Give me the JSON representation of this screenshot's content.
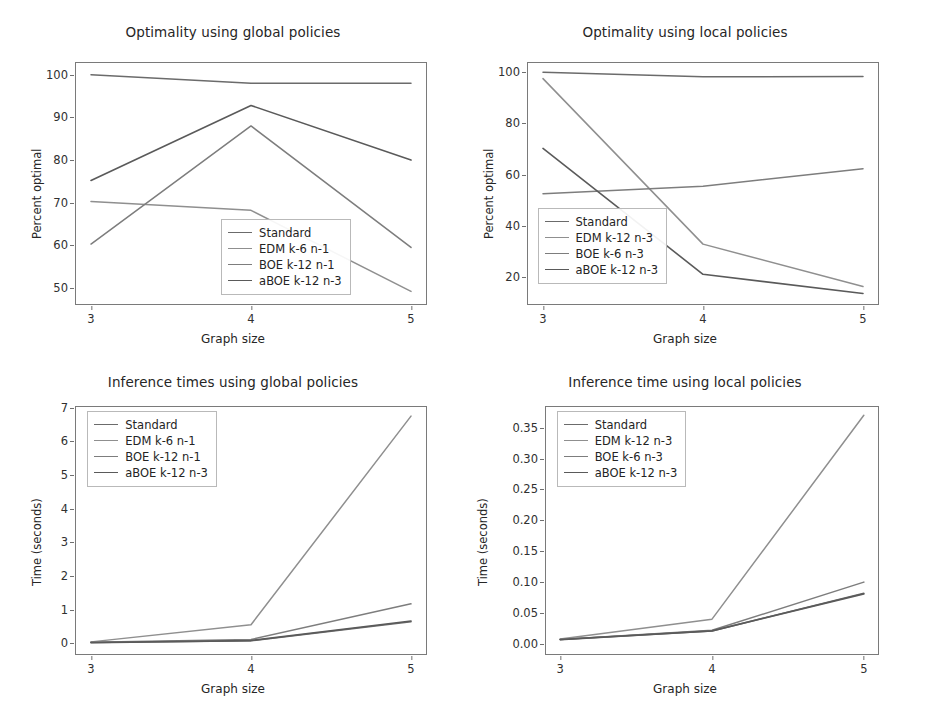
{
  "figure": {
    "background": "#ffffff",
    "palette": {
      "standard": "#6b6b6b",
      "edm": "#8f8f8f",
      "boe": "#7d7d7d",
      "aboe": "#5a5a5a"
    }
  },
  "chart_data": [
    {
      "id": "optimality-global",
      "type": "line",
      "title": "Optimality using global policies",
      "xlabel": "Graph size",
      "ylabel": "Percent optimal",
      "x": [
        3,
        4,
        5
      ],
      "xticklabels": [
        "3",
        "4",
        "5"
      ],
      "xlim": [
        2.9,
        5.1
      ],
      "ylim": [
        46,
        103
      ],
      "yticks": [
        50,
        60,
        70,
        80,
        90,
        100
      ],
      "yticklabels": [
        "50",
        "60",
        "70",
        "80",
        "90",
        "100"
      ],
      "grid": false,
      "legend_position": "center right",
      "series": [
        {
          "name": "Standard",
          "color": "#6b6b6b",
          "width": 1.5,
          "values": [
            100,
            98,
            98
          ]
        },
        {
          "name": "EDM k-6 n-1",
          "color": "#8f8f8f",
          "width": 1.5,
          "values": [
            70.3,
            68.2,
            49.2
          ]
        },
        {
          "name": "BOE k-12 n-1",
          "color": "#7d7d7d",
          "width": 1.5,
          "values": [
            60.3,
            88,
            59.5
          ]
        },
        {
          "name": "aBOE k-12 n-3",
          "color": "#5a5a5a",
          "width": 1.6,
          "values": [
            75.2,
            92.8,
            80
          ]
        }
      ]
    },
    {
      "id": "optimality-local",
      "type": "line",
      "title": "Optimality using local policies",
      "xlabel": "Graph size",
      "ylabel": "Percent optimal",
      "x": [
        3,
        4,
        5
      ],
      "xticklabels": [
        "3",
        "4",
        "5"
      ],
      "xlim": [
        2.9,
        5.1
      ],
      "ylim": [
        9,
        104
      ],
      "yticks": [
        20,
        40,
        60,
        80,
        100
      ],
      "yticklabels": [
        "20",
        "40",
        "60",
        "80",
        "100"
      ],
      "grid": false,
      "legend_position": "lower left",
      "series": [
        {
          "name": "Standard",
          "color": "#6b6b6b",
          "width": 1.5,
          "values": [
            100,
            98.2,
            98.3
          ]
        },
        {
          "name": "EDM k-12 n-3",
          "color": "#8f8f8f",
          "width": 1.5,
          "values": [
            97.5,
            32.8,
            16.2
          ]
        },
        {
          "name": "BOE k-6 n-3",
          "color": "#7d7d7d",
          "width": 1.5,
          "values": [
            52.5,
            55.4,
            62.3
          ]
        },
        {
          "name": "aBOE k-12 n-3",
          "color": "#5a5a5a",
          "width": 1.6,
          "values": [
            70.2,
            21,
            13.5
          ]
        }
      ]
    },
    {
      "id": "inference-times-global",
      "type": "line",
      "title": "Inference times using global policies",
      "xlabel": "Graph size",
      "ylabel": "Time (seconds)",
      "x": [
        3,
        4,
        5
      ],
      "xticklabels": [
        "3",
        "4",
        "5"
      ],
      "xlim": [
        2.9,
        5.1
      ],
      "ylim": [
        -0.35,
        7.05
      ],
      "yticks": [
        0,
        1,
        2,
        3,
        4,
        5,
        6,
        7
      ],
      "yticklabels": [
        "0",
        "1",
        "2",
        "3",
        "4",
        "5",
        "6",
        "7"
      ],
      "grid": false,
      "legend_position": "upper left",
      "series": [
        {
          "name": "Standard",
          "color": "#6b6b6b",
          "width": 1.5,
          "values": [
            0.02,
            0.07,
            0.64
          ]
        },
        {
          "name": "EDM k-6 n-1",
          "color": "#8f8f8f",
          "width": 1.5,
          "values": [
            0.04,
            0.55,
            6.75
          ]
        },
        {
          "name": "BOE k-12 n-1",
          "color": "#7d7d7d",
          "width": 1.5,
          "values": [
            0.03,
            0.11,
            1.17
          ]
        },
        {
          "name": "aBOE k-12 n-3",
          "color": "#5a5a5a",
          "width": 1.7,
          "values": [
            0.02,
            0.08,
            0.66
          ]
        }
      ]
    },
    {
      "id": "inference-time-local",
      "type": "line",
      "title": "Inference time using local policies",
      "xlabel": "Graph size",
      "ylabel": "Time (seconds)",
      "x": [
        3,
        4,
        5
      ],
      "xticklabels": [
        "3",
        "4",
        "5"
      ],
      "xlim": [
        2.9,
        5.1
      ],
      "ylim": [
        -0.018,
        0.385
      ],
      "yticks": [
        0.0,
        0.05,
        0.1,
        0.15,
        0.2,
        0.25,
        0.3,
        0.35
      ],
      "yticklabels": [
        "0.00",
        "0.05",
        "0.10",
        "0.15",
        "0.20",
        "0.25",
        "0.30",
        "0.35"
      ],
      "grid": false,
      "legend_position": "upper left",
      "series": [
        {
          "name": "Standard",
          "color": "#6b6b6b",
          "width": 1.5,
          "values": [
            0.007,
            0.021,
            0.082
          ]
        },
        {
          "name": "EDM k-12 n-3",
          "color": "#8f8f8f",
          "width": 1.5,
          "values": [
            0.008,
            0.04,
            0.37
          ]
        },
        {
          "name": "BOE k-6 n-3",
          "color": "#7d7d7d",
          "width": 1.5,
          "values": [
            0.007,
            0.022,
            0.1
          ]
        },
        {
          "name": "aBOE k-12 n-3",
          "color": "#5a5a5a",
          "width": 1.7,
          "values": [
            0.007,
            0.021,
            0.081
          ]
        }
      ]
    }
  ]
}
